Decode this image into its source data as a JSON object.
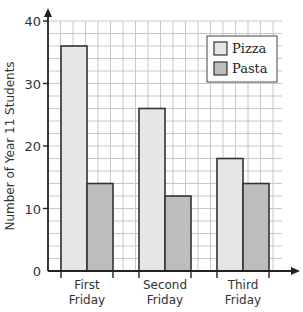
{
  "chart_data": {
    "type": "bar",
    "title": "",
    "xlabel": "",
    "ylabel": "Number of Year 11 Students",
    "ylim": [
      0,
      40
    ],
    "yticks": [
      0,
      10,
      20,
      30,
      40
    ],
    "minor_grid_step": 2,
    "grid": true,
    "legend_position": "top-right",
    "categories": [
      "First\nFriday",
      "Second\nFriday",
      "Third\nFriday"
    ],
    "category_lines": [
      [
        "First",
        "Friday"
      ],
      [
        "Second",
        "Friday"
      ],
      [
        "Third",
        "Friday"
      ]
    ],
    "series": [
      {
        "name": "Pizza",
        "values": [
          36,
          26,
          18
        ],
        "color": "#e6e6e6"
      },
      {
        "name": "Pasta",
        "values": [
          14,
          12,
          14
        ],
        "color": "#bdbdbd"
      }
    ]
  },
  "colors": {
    "axis": "#222222",
    "grid": "#c8c8c8",
    "bar_outline": "#333333"
  }
}
